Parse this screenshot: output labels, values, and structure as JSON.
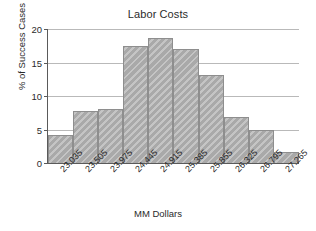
{
  "chart_data": {
    "type": "bar",
    "title": "Labor Costs",
    "xlabel": "MM Dollars",
    "ylabel": "% of Success Cases",
    "categories": [
      "23.035",
      "23.505",
      "23.975",
      "24.445",
      "24.915",
      "25.385",
      "25.855",
      "26.325",
      "26.795",
      "27.265"
    ],
    "values": [
      4.2,
      7.8,
      8.0,
      17.4,
      18.7,
      17.0,
      13.2,
      6.9,
      4.9,
      1.7
    ],
    "ylim": [
      0,
      20
    ],
    "yticks": [
      "0",
      "5",
      "10",
      "15",
      "20"
    ],
    "ytick_values": [
      0,
      5,
      10,
      15,
      20
    ],
    "grid": "horizontal",
    "legend": "none",
    "bar_color": "#a9a9a9",
    "bar_edge_color": "#8e8e8e",
    "grid_color": "#b9b9b9",
    "axis_color": "#5a5a5a",
    "background_color": "#ffffff"
  }
}
